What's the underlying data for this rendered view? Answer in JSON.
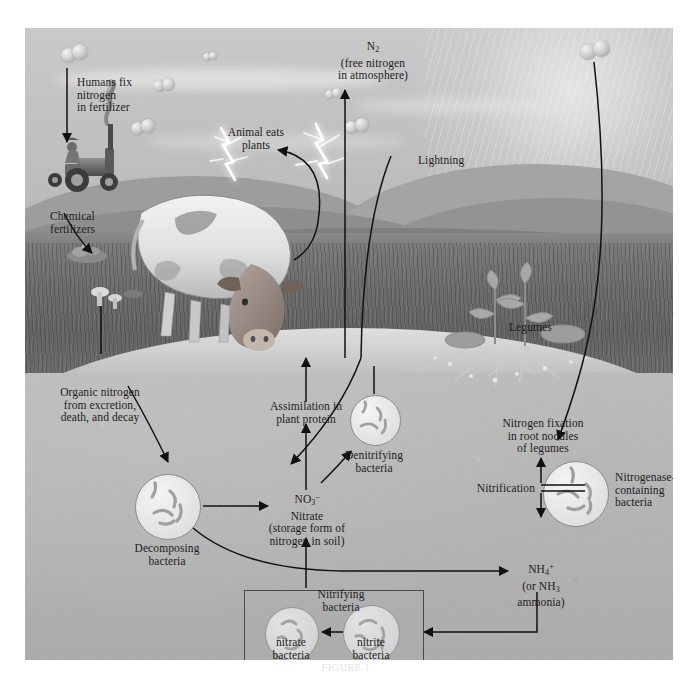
{
  "figure": {
    "caption": "FIGURE 1",
    "domain_note": "nitrogen cycle diagram"
  },
  "colors": {
    "sky": "#c6c6c6",
    "grass": "#6a6a6a",
    "soil": "#b8b8b8",
    "hills": "#8e8e8e",
    "ink": "#1c1c1c",
    "bacteria_fill": "#ececec",
    "bacteria_stroke": "#8c8c8c",
    "lightning": "#ffffff",
    "box_stroke": "#4a4a4a"
  },
  "atmosphere": {
    "n2_label_line1": "N",
    "n2_label_sub": "2",
    "n2_label_line2": "(free nitrogen",
    "n2_label_line3": "in atmosphere)",
    "lightning_label": "Lightning"
  },
  "surface": {
    "humans_fix_line1": "Humans fix",
    "humans_fix_line2": "nitrogen",
    "humans_fix_line3": "in fertilizer",
    "chemical_fertilizers_line1": "Chemical",
    "chemical_fertilizers_line2": "fertilizers",
    "animal_eats_line1": "Animal eats",
    "animal_eats_line2": "plants",
    "legumes_label": "Legumes"
  },
  "soil": {
    "organic_nitrogen_line1": "Organic nitrogen",
    "organic_nitrogen_line2": "from excretion,",
    "organic_nitrogen_line3": "death, and decay",
    "assimilation_line1": "Assimilation in",
    "assimilation_line2": "plant protein",
    "nitrate_formula": "NO",
    "nitrate_formula_sub": "3",
    "nitrate_formula_sup": "–",
    "nitrate_name": "Nitrate",
    "nitrate_desc_line1": "(storage form of",
    "nitrate_desc_line2": "nitrogen in soil)",
    "ammonium_formula": "NH",
    "ammonium_formula_sub": "4",
    "ammonium_formula_sup": "+",
    "ammonium_alt_line1": "(or NH",
    "ammonium_alt_sub": "3",
    "ammonium_alt_line2": "ammonia)",
    "nitrification_label": "Nitrification",
    "nitrogen_fixation_line1": "Nitrogen fixation",
    "nitrogen_fixation_line2": "in root nodules",
    "nitrogen_fixation_line3": "of legumes"
  },
  "bacteria": [
    {
      "id": "decomposing",
      "label_line1": "Decomposing",
      "label_line2": "bacteria"
    },
    {
      "id": "denitrifying",
      "label_line1": "Denitrifying",
      "label_line2": "bacteria"
    },
    {
      "id": "nitrogenase",
      "label_line1": "Nitrogenase-",
      "label_line2": "containing",
      "label_line3": "bacteria"
    },
    {
      "id": "nitrate",
      "label_line1": "nitrate",
      "label_line2": "bacteria"
    },
    {
      "id": "nitrite",
      "label_line1": "nitrite",
      "label_line2": "bacteria"
    }
  ],
  "nitrifying_box": {
    "title_line1": "Nitrifying",
    "title_line2": "bacteria"
  }
}
